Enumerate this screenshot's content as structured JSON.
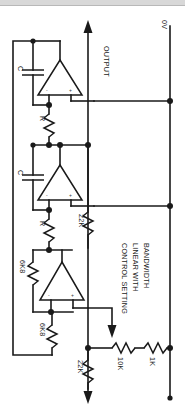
{
  "diagram": {
    "orientation": "landscape-rotated",
    "line_color": "#1a1a1a",
    "background_color": "#ffffff"
  },
  "rails": {
    "output_label": "OUTPUT",
    "zero_volt_label": "0V"
  },
  "annotation": {
    "line1": "CONTROL SETTING",
    "line2": "LINEAR WITH",
    "line3": "BANDWIDTH"
  },
  "components": [
    {
      "id": "c1",
      "ref": "C",
      "type": "capacitor",
      "label": "C"
    },
    {
      "id": "c2",
      "ref": "C",
      "type": "capacitor",
      "label": "C"
    },
    {
      "id": "r1",
      "ref": "R",
      "type": "resistor",
      "label": "R"
    },
    {
      "id": "r2",
      "ref": "R",
      "type": "resistor",
      "label": "R"
    },
    {
      "id": "r_fb_top",
      "ref": "6K8",
      "type": "resistor",
      "label": "6K8"
    },
    {
      "id": "r_fb_bottom",
      "ref": "6K8",
      "type": "resistor",
      "label": "6K8"
    },
    {
      "id": "r_22k_mid",
      "ref": "22K",
      "type": "resistor",
      "label": "22K"
    },
    {
      "id": "r_22k_bottom",
      "ref": "22K",
      "type": "resistor",
      "label": "22K"
    },
    {
      "id": "r_10k_pot",
      "ref": "10K",
      "type": "potentiometer",
      "label": "10K"
    },
    {
      "id": "r_1k",
      "ref": "1K",
      "type": "resistor",
      "label": "1K"
    }
  ],
  "opamps": [
    {
      "id": "a1",
      "minus_pin": "-",
      "plus_pin": "+"
    },
    {
      "id": "a2",
      "minus_pin": "-",
      "plus_pin": "+"
    },
    {
      "id": "a3",
      "minus_pin": "-",
      "plus_pin": "+"
    }
  ]
}
